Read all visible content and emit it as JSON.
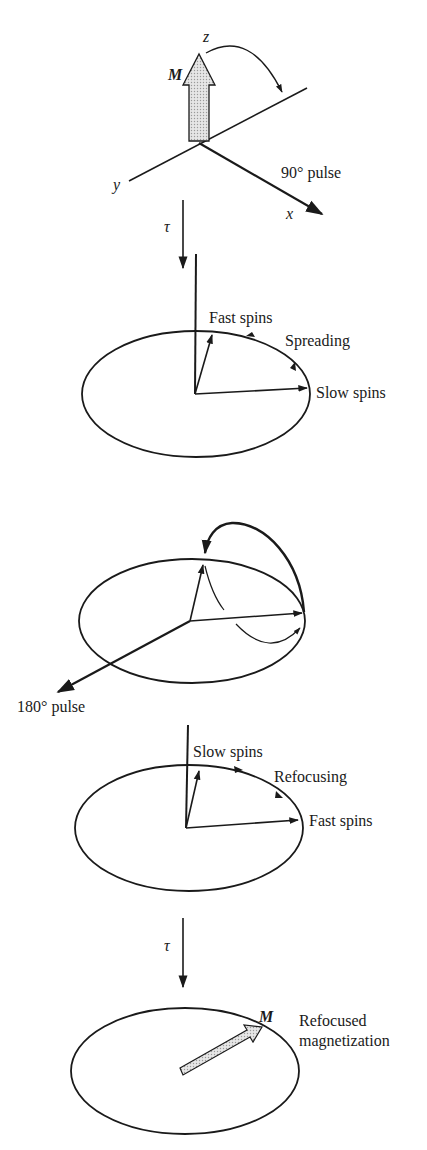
{
  "diagram": {
    "frame1": {
      "magnetization_label": "M",
      "z_label": "z",
      "y_label": "y",
      "x_label": "x",
      "pulse_label": "90° pulse"
    },
    "delay1": {
      "label": "τ"
    },
    "frame2": {
      "fast_label": "Fast spins",
      "spreading_label": "Spreading",
      "slow_label": "Slow spins"
    },
    "frame3": {
      "pulse_label": "180° pulse"
    },
    "frame4": {
      "slow_label": "Slow spins",
      "refocusing_label": "Refocusing",
      "fast_label": "Fast spins"
    },
    "delay2": {
      "label": "τ"
    },
    "frame5": {
      "magnetization_label": "M",
      "refocused_line1": "Refocused",
      "refocused_line2": "magnetization"
    },
    "colors": {
      "ink": "#1a1a1a",
      "arrow_fill": "#d9d9d9",
      "background": "#ffffff"
    }
  }
}
